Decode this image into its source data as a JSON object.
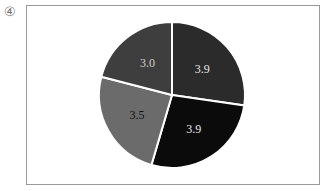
{
  "marker": "④",
  "chart_data": {
    "type": "pie",
    "title": "",
    "values": [
      3.9,
      3.9,
      3.5,
      3.0
    ],
    "labels": [
      "3.9",
      "3.9",
      "3.5",
      "3.0"
    ],
    "colors": [
      "#2b2b2b",
      "#0b0b0b",
      "#6b6b6b",
      "#3e3e3e"
    ],
    "label_colors": [
      "#e6e6e6",
      "#e6e6e6",
      "#111111",
      "#cfcfcf"
    ],
    "start_angle": "top (12 o'clock)",
    "direction": "clockwise",
    "legend": "none"
  }
}
